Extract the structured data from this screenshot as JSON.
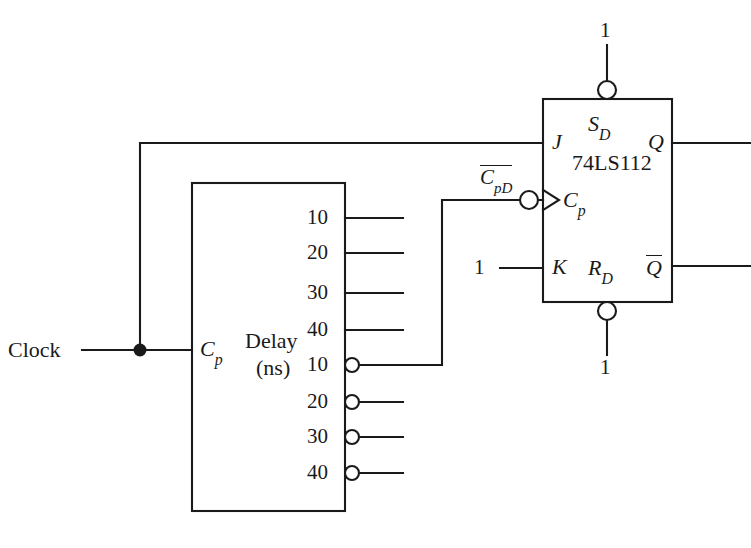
{
  "figure": {
    "title": "",
    "background_color": "#ffffff",
    "line_color": "#1a1a1a"
  },
  "labels": {
    "clock": "Clock",
    "delay_line1": "Delay",
    "delay_line2": "(ns)",
    "delay_clock_pin": "C",
    "delay_clock_pin_sub": "p",
    "chip_name": "74LS112",
    "j_input": "J",
    "k_input": "K",
    "clock_input": "C",
    "clock_input_sub": "p",
    "set_pin": "S",
    "set_pin_sub": "D",
    "reset_pin": "R",
    "reset_pin_sub": "D",
    "q_output": "Q",
    "qbar_output": "Q",
    "cpd_signal": "C",
    "cpd_signal_sub": "pD",
    "const_one_set": "1",
    "const_one_reset": "1",
    "const_one_k": "1"
  },
  "delay_block": {
    "name": "Delay (ns)",
    "input_label": "Cp",
    "outputs_noninverted": [
      {
        "label": "10",
        "inverted": false
      },
      {
        "label": "20",
        "inverted": false
      },
      {
        "label": "30",
        "inverted": false
      },
      {
        "label": "40",
        "inverted": false
      }
    ],
    "outputs_inverted": [
      {
        "label": "10",
        "inverted": true
      },
      {
        "label": "20",
        "inverted": true
      },
      {
        "label": "30",
        "inverted": true
      },
      {
        "label": "40",
        "inverted": true
      }
    ]
  },
  "flipflop": {
    "part_number": "74LS112",
    "inputs": [
      "J",
      "K",
      "Cp"
    ],
    "outputs": [
      "Q",
      "Qbar"
    ],
    "async_inputs": [
      "SD",
      "RD"
    ],
    "async_values": [
      "1",
      "1"
    ],
    "k_value": "1"
  },
  "connections": [
    {
      "from": "Clock",
      "to": "Delay.Cp"
    },
    {
      "from": "Clock",
      "to": "74LS112.J"
    },
    {
      "from": "Delay.10_inverted",
      "to": "74LS112.Cp"
    },
    {
      "from": "1",
      "to": "74LS112.SD"
    },
    {
      "from": "1",
      "to": "74LS112.RD"
    },
    {
      "from": "1",
      "to": "74LS112.K"
    }
  ]
}
